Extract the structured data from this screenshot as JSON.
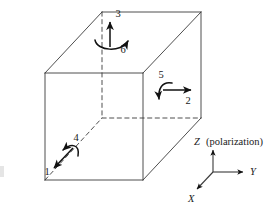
{
  "figure": {
    "type": "piezoelectric-axis-convention-cube",
    "background_color": "#ffffff",
    "line_color": "#3a3a3a",
    "arrow_color": "#111111",
    "text_color": "#1a1a1a"
  },
  "cube": {
    "description": "Oblique-projected cube with hidden edges dashed",
    "front_face": {
      "left": 45,
      "top": 73,
      "right": 143,
      "bottom": 180
    },
    "depth_offset": {
      "dx": 57,
      "dy": -61
    },
    "solid_edges": [
      [
        45,
        73,
        143,
        73
      ],
      [
        45,
        73,
        45,
        180
      ],
      [
        45,
        180,
        143,
        180
      ],
      [
        143,
        73,
        143,
        180
      ],
      [
        45,
        73,
        102,
        12
      ],
      [
        143,
        73,
        201,
        12
      ],
      [
        143,
        180,
        201,
        118
      ],
      [
        102,
        12,
        201,
        12
      ],
      [
        201,
        12,
        201,
        118
      ]
    ],
    "dashed_edges": [
      [
        102,
        12,
        102,
        118
      ],
      [
        102,
        118,
        201,
        118
      ],
      [
        45,
        180,
        102,
        118
      ]
    ]
  },
  "annotations": [
    {
      "id": "3",
      "label": "3",
      "kind": "straight-arrow",
      "face": "top",
      "direction": "up",
      "label_x": 118,
      "label_y": 17
    },
    {
      "id": "6",
      "label": "6",
      "kind": "curved-arrow",
      "face": "top",
      "direction": "counterclockwise-sweep-right",
      "label_x": 123,
      "label_y": 53
    },
    {
      "id": "5",
      "label": "5",
      "kind": "curved-arrow",
      "face": "right",
      "direction": "hook-down-left",
      "label_x": 161,
      "label_y": 78
    },
    {
      "id": "2",
      "label": "2",
      "kind": "straight-arrow",
      "face": "right",
      "direction": "right",
      "label_x": 188,
      "label_y": 104
    },
    {
      "id": "4",
      "label": "4",
      "kind": "curved-arrow",
      "face": "bottom",
      "direction": "arc-head-left",
      "label_x": 76,
      "label_y": 141
    },
    {
      "id": "1",
      "label": "1",
      "kind": "straight-arrow",
      "face": "bottom",
      "direction": "down-left",
      "label_x": 47,
      "label_y": 175
    }
  ],
  "axes": {
    "origin": {
      "x": 213,
      "y": 172
    },
    "z": {
      "label": "Z",
      "annotation": "(polarization)",
      "full_label": "Z (polarization)",
      "direction": "up",
      "tip": {
        "x": 213,
        "y": 149
      },
      "label_x": 194,
      "label_y": 145
    },
    "y": {
      "label": "Y",
      "direction": "right",
      "tip": {
        "x": 244,
        "y": 172
      },
      "label_x": 250,
      "label_y": 175
    },
    "x": {
      "label": "X",
      "direction": "down-left",
      "tip": {
        "x": 196,
        "y": 190
      },
      "label_x": 188,
      "label_y": 202
    }
  }
}
